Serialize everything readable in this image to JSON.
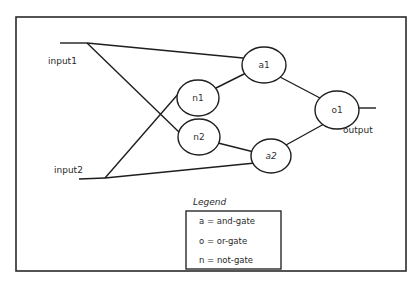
{
  "diagram": {
    "type": "logic-circuit",
    "inputs": [
      {
        "id": "input1",
        "label": "input1"
      },
      {
        "id": "input2",
        "label": "input2"
      }
    ],
    "output": {
      "label": "output"
    },
    "gates": [
      {
        "id": "a1",
        "label": "a1",
        "kind": "and-gate"
      },
      {
        "id": "n1",
        "label": "n1",
        "kind": "not-gate"
      },
      {
        "id": "n2",
        "label": "n2",
        "kind": "not-gate"
      },
      {
        "id": "a2",
        "label": "a2",
        "kind": "and-gate"
      },
      {
        "id": "o1",
        "label": "o1",
        "kind": "or-gate"
      }
    ],
    "edges": [
      {
        "from": "input1",
        "to": "a1"
      },
      {
        "from": "input1",
        "to": "n2"
      },
      {
        "from": "input2",
        "to": "n1"
      },
      {
        "from": "input2",
        "to": "a2"
      },
      {
        "from": "n1",
        "to": "a1"
      },
      {
        "from": "n2",
        "to": "a2"
      },
      {
        "from": "a1",
        "to": "o1"
      },
      {
        "from": "a2",
        "to": "o1"
      },
      {
        "from": "o1",
        "to": "output"
      }
    ]
  },
  "legend": {
    "title": "Legend",
    "items": [
      {
        "label": "a = and-gate"
      },
      {
        "label": "o = or-gate"
      },
      {
        "label": "n = not-gate"
      }
    ]
  },
  "colors": {
    "stroke": "#1e1e1e",
    "background": "#ffffff"
  }
}
